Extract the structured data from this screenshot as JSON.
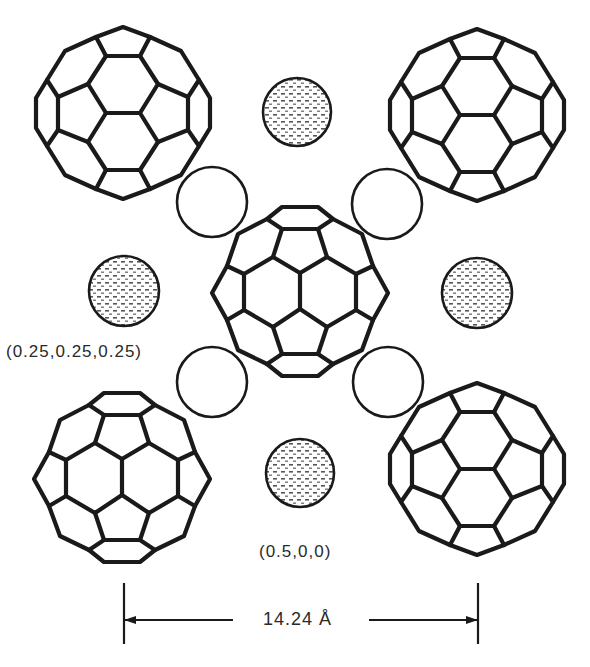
{
  "figure": {
    "colors": {
      "line": "#1a1a1a",
      "background": "#ffffff",
      "text": "#2a2a2a",
      "dot": "#555555"
    }
  },
  "labels": {
    "tetrahedral_site": "(0.25,0.25,0.25)",
    "octahedral_site": "(0.5,0,0)",
    "lattice_constant": "14.24 Å"
  },
  "templates": {
    "A": [
      [
        [
          -17,
          0
        ],
        [
          17,
          0
        ]
      ],
      [
        [
          -17,
          0
        ],
        [
          -35,
          -29
        ],
        [
          -17,
          -57
        ],
        [
          17,
          -57
        ],
        [
          35,
          -29
        ],
        [
          17,
          0
        ]
      ],
      [
        [
          -17,
          0
        ],
        [
          -35,
          29
        ],
        [
          -17,
          57
        ],
        [
          17,
          57
        ],
        [
          35,
          29
        ],
        [
          17,
          0
        ]
      ],
      [
        [
          -17,
          -57
        ],
        [
          -27,
          -76
        ],
        [
          0,
          -86
        ],
        [
          27,
          -76
        ],
        [
          17,
          -57
        ]
      ],
      [
        [
          -17,
          57
        ],
        [
          -27,
          76
        ],
        [
          0,
          86
        ],
        [
          27,
          76
        ],
        [
          17,
          57
        ]
      ],
      [
        [
          -35,
          -29
        ],
        [
          -65,
          -16
        ],
        [
          -65,
          17
        ],
        [
          -35,
          29
        ]
      ],
      [
        [
          35,
          -29
        ],
        [
          65,
          -16
        ],
        [
          65,
          17
        ],
        [
          35,
          29
        ]
      ],
      [
        [
          -27,
          -76
        ],
        [
          -58,
          -62
        ],
        [
          -76,
          -33
        ],
        [
          -65,
          -16
        ]
      ],
      [
        [
          27,
          -76
        ],
        [
          58,
          -62
        ],
        [
          76,
          -33
        ],
        [
          65,
          -16
        ]
      ],
      [
        [
          -27,
          76
        ],
        [
          -58,
          62
        ],
        [
          -76,
          33
        ],
        [
          -65,
          17
        ]
      ],
      [
        [
          27,
          76
        ],
        [
          58,
          62
        ],
        [
          76,
          33
        ],
        [
          65,
          17
        ]
      ],
      [
        [
          -76,
          -33
        ],
        [
          -87,
          -15
        ],
        [
          -87,
          15
        ],
        [
          -76,
          33
        ]
      ],
      [
        [
          76,
          -33
        ],
        [
          87,
          -15
        ],
        [
          87,
          15
        ],
        [
          76,
          33
        ]
      ]
    ],
    "B": [
      [
        [
          0,
          -18
        ],
        [
          0,
          18
        ]
      ],
      [
        [
          0,
          -18
        ],
        [
          -27,
          -34
        ],
        [
          -56,
          -17
        ],
        [
          -56,
          19
        ],
        [
          -27,
          36
        ],
        [
          0,
          18
        ]
      ],
      [
        [
          0,
          -18
        ],
        [
          27,
          -34
        ],
        [
          56,
          -17
        ],
        [
          56,
          19
        ],
        [
          27,
          36
        ],
        [
          0,
          18
        ]
      ],
      [
        [
          -27,
          -34
        ],
        [
          -18,
          -62
        ],
        [
          18,
          -62
        ],
        [
          27,
          -34
        ]
      ],
      [
        [
          -27,
          36
        ],
        [
          -18,
          63
        ],
        [
          18,
          63
        ],
        [
          27,
          36
        ]
      ],
      [
        [
          -18,
          -62
        ],
        [
          -33,
          -72
        ],
        [
          -18,
          -84
        ],
        [
          18,
          -84
        ],
        [
          33,
          -72
        ],
        [
          18,
          -62
        ]
      ],
      [
        [
          -18,
          63
        ],
        [
          -33,
          73
        ],
        [
          -18,
          85
        ],
        [
          18,
          85
        ],
        [
          33,
          73
        ],
        [
          18,
          63
        ]
      ],
      [
        [
          -33,
          -72
        ],
        [
          -62,
          -57
        ],
        [
          -73,
          -25
        ],
        [
          -56,
          -17
        ]
      ],
      [
        [
          33,
          -72
        ],
        [
          62,
          -57
        ],
        [
          73,
          -25
        ],
        [
          56,
          -17
        ]
      ],
      [
        [
          -33,
          73
        ],
        [
          -62,
          59
        ],
        [
          -73,
          29
        ],
        [
          -56,
          19
        ]
      ],
      [
        [
          33,
          73
        ],
        [
          62,
          59
        ],
        [
          73,
          29
        ],
        [
          56,
          19
        ]
      ],
      [
        [
          -73,
          -25
        ],
        [
          -88,
          2
        ],
        [
          -73,
          29
        ]
      ],
      [
        [
          73,
          -25
        ],
        [
          88,
          2
        ],
        [
          73,
          29
        ]
      ]
    ]
  },
  "buckyballs": [
    {
      "name": "top-left",
      "cx": 123,
      "cy": 113,
      "orientation": "A",
      "scale": 1.0
    },
    {
      "name": "top-right",
      "cx": 477,
      "cy": 115,
      "orientation": "A",
      "scale": 1.0
    },
    {
      "name": "center",
      "cx": 300,
      "cy": 291,
      "orientation": "B",
      "scale": 1.0
    },
    {
      "name": "bottom-left",
      "cx": 122,
      "cy": 477,
      "orientation": "B",
      "scale": 1.0
    },
    {
      "name": "bottom-right",
      "cx": 477,
      "cy": 469,
      "orientation": "A",
      "scale": 1.0
    }
  ],
  "open_circles": [
    {
      "name": "tetrahedral-site-ul",
      "cx": 212,
      "cy": 202,
      "r": 35
    },
    {
      "name": "tetrahedral-site-ur",
      "cx": 387,
      "cy": 204,
      "r": 35
    },
    {
      "name": "tetrahedral-site-ll",
      "cx": 212,
      "cy": 382,
      "r": 35
    },
    {
      "name": "tetrahedral-site-lr",
      "cx": 388,
      "cy": 382,
      "r": 35
    }
  ],
  "dotted_circles": [
    {
      "name": "octahedral-site-top",
      "cx": 297,
      "cy": 112,
      "r": 34
    },
    {
      "name": "octahedral-site-left",
      "cx": 124,
      "cy": 291,
      "r": 35
    },
    {
      "name": "octahedral-site-right",
      "cx": 477,
      "cy": 293,
      "r": 35
    },
    {
      "name": "octahedral-site-bottom",
      "cx": 300,
      "cy": 473,
      "r": 34
    }
  ],
  "dimension": {
    "left_x": 124,
    "right_x": 478,
    "tick_top": 583,
    "tick_bottom": 644,
    "arrow_y": 620,
    "left_line_end": 233,
    "right_line_start": 369
  }
}
